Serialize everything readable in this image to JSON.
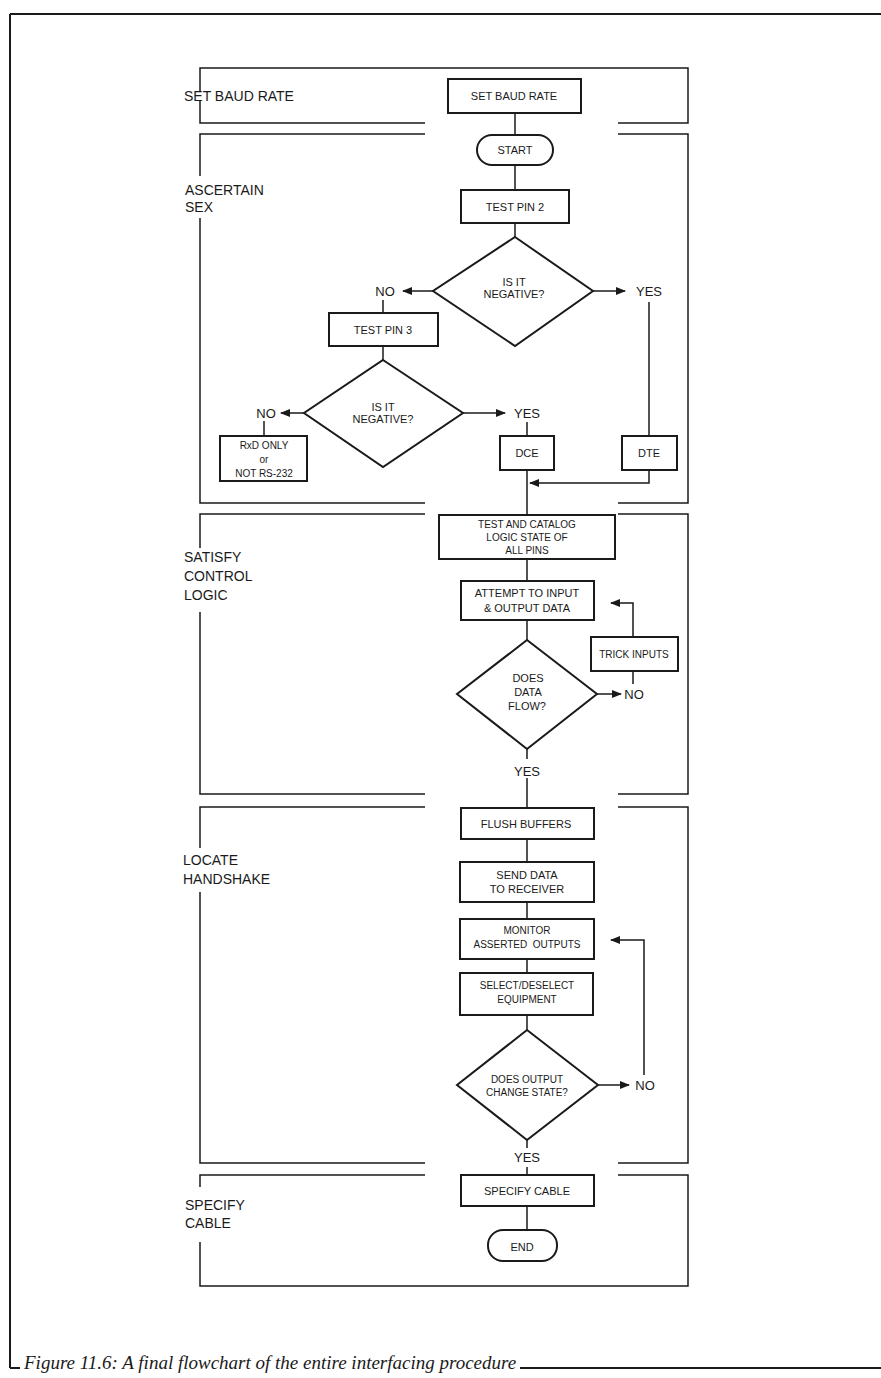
{
  "figure": {
    "caption": "Figure 11.6: A final flowchart of the entire interfacing procedure"
  },
  "sections": [
    {
      "id": "baud",
      "label_lines": [
        "SET BAUD RATE"
      ]
    },
    {
      "id": "sex",
      "label_lines": [
        "ASCERTAIN",
        "SEX"
      ]
    },
    {
      "id": "control",
      "label_lines": [
        "SATISFY",
        "CONTROL",
        "LOGIC"
      ]
    },
    {
      "id": "handshake",
      "label_lines": [
        "LOCATE",
        "HANDSHAKE"
      ]
    },
    {
      "id": "cable",
      "label_lines": [
        "SPECIFY",
        "CABLE"
      ]
    }
  ],
  "nodes": {
    "set_baud_rate": {
      "type": "process",
      "lines": [
        "SET BAUD RATE"
      ]
    },
    "start": {
      "type": "terminator",
      "lines": [
        "START"
      ]
    },
    "test_pin_2": {
      "type": "process",
      "lines": [
        "TEST PIN 2"
      ]
    },
    "is_negative_1": {
      "type": "decision",
      "lines": [
        "IS IT",
        "NEGATIVE?"
      ]
    },
    "test_pin_3": {
      "type": "process",
      "lines": [
        "TEST PIN 3"
      ]
    },
    "is_negative_2": {
      "type": "decision",
      "lines": [
        "IS IT",
        "NEGATIVE?"
      ]
    },
    "rxd_only": {
      "type": "process",
      "lines": [
        "RxD ONLY",
        "or",
        "NOT RS-232"
      ]
    },
    "dce": {
      "type": "process",
      "lines": [
        "DCE"
      ]
    },
    "dte": {
      "type": "process",
      "lines": [
        "DTE"
      ]
    },
    "test_catalog": {
      "type": "process",
      "lines": [
        "TEST AND CATALOG",
        "LOGIC STATE OF",
        "ALL PINS"
      ]
    },
    "attempt_io": {
      "type": "process",
      "lines": [
        "ATTEMPT TO INPUT",
        "& OUTPUT DATA"
      ]
    },
    "trick_inputs": {
      "type": "process",
      "lines": [
        "TRICK INPUTS"
      ]
    },
    "data_flow": {
      "type": "decision",
      "lines": [
        "DOES",
        "DATA",
        "FLOW?"
      ]
    },
    "flush_buffers": {
      "type": "process",
      "lines": [
        "FLUSH BUFFERS"
      ]
    },
    "send_data": {
      "type": "process",
      "lines": [
        "SEND DATA",
        "TO RECEIVER"
      ]
    },
    "monitor_outputs": {
      "type": "process",
      "lines": [
        "MONITOR",
        "ASSERTED  OUTPUTS"
      ]
    },
    "select_equipment": {
      "type": "process",
      "lines": [
        "SELECT/DESELECT",
        "EQUIPMENT"
      ]
    },
    "output_change": {
      "type": "decision",
      "lines": [
        "DOES OUTPUT",
        "CHANGE STATE?"
      ]
    },
    "specify_cable": {
      "type": "process",
      "lines": [
        "SPECIFY CABLE"
      ]
    },
    "end": {
      "type": "terminator",
      "lines": [
        "END"
      ]
    }
  },
  "branches": {
    "neg1_no": "NO",
    "neg1_yes": "YES",
    "neg2_no": "NO",
    "neg2_yes": "YES",
    "flow_no": "NO",
    "flow_yes": "YES",
    "change_no": "NO",
    "change_yes": "YES"
  },
  "colors": {
    "ink": "#1a1a1a",
    "paper": "#ffffff"
  }
}
